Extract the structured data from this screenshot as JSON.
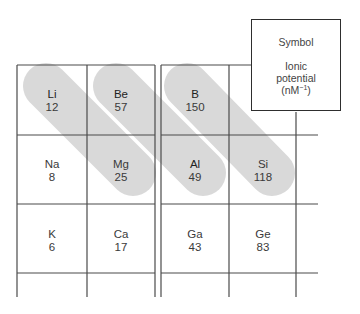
{
  "diagram": {
    "legend": {
      "symbol_label": "Symbol",
      "ionic_label_line1": "Ionic",
      "ionic_label_line2": "potential",
      "unit_base": "(nM",
      "unit_exp": "−1",
      "unit_close": ")"
    },
    "cells": [
      {
        "symbol": "Li",
        "value": "12",
        "row": 0,
        "col": 0
      },
      {
        "symbol": "Be",
        "value": "57",
        "row": 0,
        "col": 1
      },
      {
        "symbol": "B",
        "value": "150",
        "row": 0,
        "col": 2
      },
      {
        "symbol": "Na",
        "value": "8",
        "row": 1,
        "col": 0
      },
      {
        "symbol": "Mg",
        "value": "25",
        "row": 1,
        "col": 1
      },
      {
        "symbol": "Al",
        "value": "49",
        "row": 1,
        "col": 2
      },
      {
        "symbol": "Si",
        "value": "118",
        "row": 1,
        "col": 3
      },
      {
        "symbol": "K",
        "value": "6",
        "row": 2,
        "col": 0
      },
      {
        "symbol": "Ca",
        "value": "17",
        "row": 2,
        "col": 1
      },
      {
        "symbol": "Ga",
        "value": "43",
        "row": 2,
        "col": 2
      },
      {
        "symbol": "Ge",
        "value": "83",
        "row": 2,
        "col": 3
      }
    ],
    "diagonal_pairs": [
      {
        "from": "Li",
        "to": "Mg"
      },
      {
        "from": "Be",
        "to": "Al"
      },
      {
        "from": "B",
        "to": "Si"
      }
    ],
    "colors": {
      "highlight": "#d9d9d9",
      "grid": "#4a4a4a",
      "text": "#3a3a3a"
    }
  }
}
